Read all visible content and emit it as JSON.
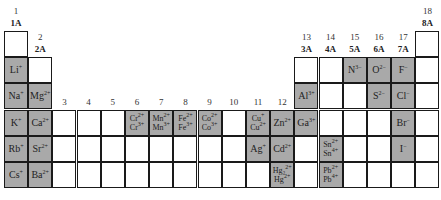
{
  "colors": {
    "fill": "#a9a9a9",
    "grid": "#1a1a1a",
    "empty": "#ffffff"
  },
  "headers": [
    {
      "col": 1,
      "num": "1",
      "grp": "1A"
    },
    {
      "col": 2,
      "num": "2",
      "grp": "2A"
    },
    {
      "col": 3,
      "num": "3",
      "grp": ""
    },
    {
      "col": 4,
      "num": "4",
      "grp": ""
    },
    {
      "col": 5,
      "num": "5",
      "grp": ""
    },
    {
      "col": 6,
      "num": "6",
      "grp": ""
    },
    {
      "col": 7,
      "num": "7",
      "grp": ""
    },
    {
      "col": 8,
      "num": "8",
      "grp": ""
    },
    {
      "col": 9,
      "num": "9",
      "grp": ""
    },
    {
      "col": 10,
      "num": "10",
      "grp": ""
    },
    {
      "col": 11,
      "num": "11",
      "grp": ""
    },
    {
      "col": 12,
      "num": "12",
      "grp": ""
    },
    {
      "col": 13,
      "num": "13",
      "grp": "3A"
    },
    {
      "col": 14,
      "num": "14",
      "grp": "4A"
    },
    {
      "col": 15,
      "num": "15",
      "grp": "5A"
    },
    {
      "col": 16,
      "num": "16",
      "grp": "6A"
    },
    {
      "col": 17,
      "num": "17",
      "grp": "7A"
    },
    {
      "col": 18,
      "num": "18",
      "grp": "8A"
    }
  ],
  "cells": [
    {
      "row": 1,
      "col": 1,
      "ions": []
    },
    {
      "row": 1,
      "col": 18,
      "ions": []
    },
    {
      "row": 2,
      "col": 1,
      "ions": [
        [
          "Li",
          "+"
        ]
      ]
    },
    {
      "row": 2,
      "col": 2,
      "ions": []
    },
    {
      "row": 2,
      "col": 13,
      "ions": []
    },
    {
      "row": 2,
      "col": 14,
      "ions": []
    },
    {
      "row": 2,
      "col": 15,
      "ions": [
        [
          "N",
          "3−"
        ]
      ]
    },
    {
      "row": 2,
      "col": 16,
      "ions": [
        [
          "O",
          "2−"
        ]
      ]
    },
    {
      "row": 2,
      "col": 17,
      "ions": [
        [
          "F",
          "−"
        ]
      ]
    },
    {
      "row": 2,
      "col": 18,
      "ions": []
    },
    {
      "row": 3,
      "col": 1,
      "ions": [
        [
          "Na",
          "+"
        ]
      ]
    },
    {
      "row": 3,
      "col": 2,
      "ions": [
        [
          "Mg",
          "2+"
        ]
      ]
    },
    {
      "row": 3,
      "col": 13,
      "ions": [
        [
          "Al",
          "3+"
        ]
      ]
    },
    {
      "row": 3,
      "col": 14,
      "ions": []
    },
    {
      "row": 3,
      "col": 15,
      "ions": []
    },
    {
      "row": 3,
      "col": 16,
      "ions": [
        [
          "S",
          "2−"
        ]
      ]
    },
    {
      "row": 3,
      "col": 17,
      "ions": [
        [
          "Cl",
          "−"
        ]
      ]
    },
    {
      "row": 3,
      "col": 18,
      "ions": []
    },
    {
      "row": 4,
      "col": 1,
      "ions": [
        [
          "K",
          "+"
        ]
      ]
    },
    {
      "row": 4,
      "col": 2,
      "ions": [
        [
          "Ca",
          "2+"
        ]
      ]
    },
    {
      "row": 4,
      "col": 3,
      "ions": []
    },
    {
      "row": 4,
      "col": 4,
      "ions": []
    },
    {
      "row": 4,
      "col": 5,
      "ions": []
    },
    {
      "row": 4,
      "col": 6,
      "ions": [
        [
          "Cr",
          "2+"
        ],
        [
          "Cr",
          "3+"
        ]
      ]
    },
    {
      "row": 4,
      "col": 7,
      "ions": [
        [
          "Mn",
          "2+"
        ],
        [
          "Mn",
          "3+"
        ]
      ]
    },
    {
      "row": 4,
      "col": 8,
      "ions": [
        [
          "Fe",
          "2+"
        ],
        [
          "Fe",
          "3+"
        ]
      ]
    },
    {
      "row": 4,
      "col": 9,
      "ions": [
        [
          "Co",
          "2+"
        ],
        [
          "Co",
          "3+"
        ]
      ]
    },
    {
      "row": 4,
      "col": 10,
      "ions": []
    },
    {
      "row": 4,
      "col": 11,
      "ions": [
        [
          "Cu",
          "+"
        ],
        [
          "Cu",
          "2+"
        ]
      ]
    },
    {
      "row": 4,
      "col": 12,
      "ions": [
        [
          "Zn",
          "2+"
        ]
      ]
    },
    {
      "row": 4,
      "col": 13,
      "ions": [
        [
          "Ga",
          "3+"
        ]
      ]
    },
    {
      "row": 4,
      "col": 14,
      "ions": []
    },
    {
      "row": 4,
      "col": 15,
      "ions": []
    },
    {
      "row": 4,
      "col": 16,
      "ions": []
    },
    {
      "row": 4,
      "col": 17,
      "ions": [
        [
          "Br",
          "−"
        ]
      ]
    },
    {
      "row": 4,
      "col": 18,
      "ions": []
    },
    {
      "row": 5,
      "col": 1,
      "ions": [
        [
          "Rb",
          "+"
        ]
      ]
    },
    {
      "row": 5,
      "col": 2,
      "ions": [
        [
          "Sr",
          "2+"
        ]
      ]
    },
    {
      "row": 5,
      "col": 3,
      "ions": []
    },
    {
      "row": 5,
      "col": 4,
      "ions": []
    },
    {
      "row": 5,
      "col": 5,
      "ions": []
    },
    {
      "row": 5,
      "col": 6,
      "ions": []
    },
    {
      "row": 5,
      "col": 7,
      "ions": []
    },
    {
      "row": 5,
      "col": 8,
      "ions": []
    },
    {
      "row": 5,
      "col": 9,
      "ions": []
    },
    {
      "row": 5,
      "col": 10,
      "ions": []
    },
    {
      "row": 5,
      "col": 11,
      "ions": [
        [
          "Ag",
          "+"
        ]
      ]
    },
    {
      "row": 5,
      "col": 12,
      "ions": [
        [
          "Cd",
          "2+"
        ]
      ]
    },
    {
      "row": 5,
      "col": 13,
      "ions": []
    },
    {
      "row": 5,
      "col": 14,
      "ions": [
        [
          "Sn",
          "2+"
        ],
        [
          "Sn",
          "4+"
        ]
      ]
    },
    {
      "row": 5,
      "col": 15,
      "ions": []
    },
    {
      "row": 5,
      "col": 16,
      "ions": []
    },
    {
      "row": 5,
      "col": 17,
      "ions": [
        [
          "I",
          "−"
        ]
      ]
    },
    {
      "row": 5,
      "col": 18,
      "ions": []
    },
    {
      "row": 6,
      "col": 1,
      "ions": [
        [
          "Cs",
          "+"
        ]
      ]
    },
    {
      "row": 6,
      "col": 2,
      "ions": [
        [
          "Ba",
          "2+"
        ]
      ]
    },
    {
      "row": 6,
      "col": 3,
      "ions": []
    },
    {
      "row": 6,
      "col": 4,
      "ions": []
    },
    {
      "row": 6,
      "col": 5,
      "ions": []
    },
    {
      "row": 6,
      "col": 6,
      "ions": []
    },
    {
      "row": 6,
      "col": 7,
      "ions": []
    },
    {
      "row": 6,
      "col": 8,
      "ions": []
    },
    {
      "row": 6,
      "col": 9,
      "ions": []
    },
    {
      "row": 6,
      "col": 10,
      "ions": []
    },
    {
      "row": 6,
      "col": 11,
      "ions": []
    },
    {
      "row": 6,
      "col": 12,
      "ions": [
        [
          "Hg₂",
          "2+"
        ],
        [
          "Hg",
          "2+"
        ]
      ]
    },
    {
      "row": 6,
      "col": 13,
      "ions": []
    },
    {
      "row": 6,
      "col": 14,
      "ions": [
        [
          "Pb",
          "2+"
        ],
        [
          "Pb",
          "4+"
        ]
      ]
    },
    {
      "row": 6,
      "col": 15,
      "ions": []
    },
    {
      "row": 6,
      "col": 16,
      "ions": []
    },
    {
      "row": 6,
      "col": 17,
      "ions": []
    },
    {
      "row": 6,
      "col": 18,
      "ions": []
    }
  ]
}
